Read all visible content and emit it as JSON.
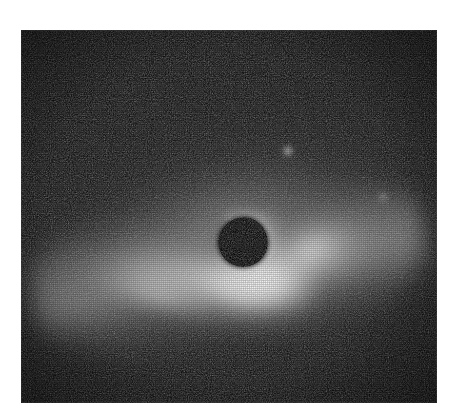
{
  "figure": {
    "kind": "astronomical-coronagraph-image",
    "caption": "",
    "colormode": "grayscale",
    "canvas": {
      "width": 457,
      "height": 420,
      "background": "#ffffff"
    },
    "panel": {
      "x": 21,
      "y": 30,
      "width": 416,
      "height": 373,
      "background": "#060606",
      "border": "none"
    }
  },
  "palette": {
    "page_background": "#ffffff",
    "sky_background": "#060606",
    "sky_mid": "#121212",
    "nebula_faint": "#4a4a4a",
    "nebula_mid": "#9a9a9a",
    "nebula_bright": "#e6e6e6",
    "nebula_peak": "#ffffff",
    "occulter": "#000000"
  },
  "scene": {
    "occulter": {
      "label": "coronagraphic occulting spot",
      "center_x": 243,
      "center_y": 242,
      "radius": 25,
      "color": "#000000"
    },
    "nebulosity": {
      "label": "circumstellar disk nebulosity",
      "position_angle_deg": -12,
      "brightest_region": {
        "x": 205,
        "y": 303
      },
      "extent_note": "sweeping arc from lower-left through center to upper-right"
    },
    "point_sources": [
      {
        "name": "field-star-1",
        "x": 288,
        "y": 151,
        "radius": 7,
        "peak": "#c8c8c8",
        "relative_brightness": 1.0
      },
      {
        "name": "field-star-2",
        "x": 383,
        "y": 197,
        "radius": 6,
        "peak": "#9a9a9a",
        "relative_brightness": 0.62
      }
    ],
    "features": [
      {
        "name": "bright-arc-main",
        "x": 200,
        "y": 305,
        "note": "brightest crescent below and left of the occulter"
      },
      {
        "name": "bright-core-lobe",
        "x": 255,
        "y": 290,
        "note": "peak-white lobe adjacent to the occulter"
      },
      {
        "name": "ne-lobe",
        "x": 300,
        "y": 255,
        "note": "bright lobe extending to the upper right"
      },
      {
        "name": "ne-plume",
        "x": 350,
        "y": 200,
        "note": "faint diffuse plume toward upper right"
      },
      {
        "name": "sw-streak",
        "x": 85,
        "y": 315,
        "note": "faint streak toward lower left"
      },
      {
        "name": "occulter-rim",
        "x": 262,
        "y": 225,
        "note": "bright rim hugging the upper-right edge of the mask"
      }
    ],
    "noise": {
      "type": "film-grain-dither",
      "amount": 0.55
    }
  }
}
